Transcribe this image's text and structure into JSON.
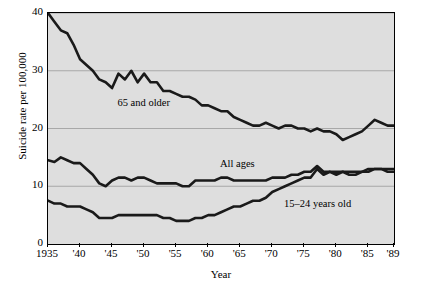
{
  "chart_data": {
    "type": "line",
    "title": "",
    "xlabel": "Year",
    "ylabel": "Suicide rate per 100,000",
    "xlim": [
      1935,
      1989
    ],
    "ylim": [
      0,
      40
    ],
    "yticks": [
      0,
      10,
      20,
      30,
      40
    ],
    "ytick_labels": [
      "0",
      "10",
      "20",
      "30",
      "40"
    ],
    "xticks": [
      1935,
      1940,
      1945,
      1950,
      1955,
      1960,
      1965,
      1970,
      1975,
      1980,
      1985,
      1989
    ],
    "xtick_labels": [
      "1935",
      "'40",
      "'45",
      "'50",
      "'55",
      "'60",
      "'65",
      "'70",
      "'75",
      "'80",
      "'85",
      "'89"
    ],
    "grid": "horizontal",
    "legend": "inline-annotations",
    "background": "#dedede",
    "line_color": "#1a1a1a",
    "series": [
      {
        "name": "65 and older",
        "label": "65 and older",
        "x": [
          1935,
          1936,
          1937,
          1938,
          1939,
          1940,
          1941,
          1942,
          1943,
          1944,
          1945,
          1946,
          1947,
          1948,
          1949,
          1950,
          1951,
          1952,
          1953,
          1954,
          1955,
          1956,
          1957,
          1958,
          1959,
          1960,
          1961,
          1962,
          1963,
          1964,
          1965,
          1966,
          1967,
          1968,
          1969,
          1970,
          1971,
          1972,
          1973,
          1974,
          1975,
          1976,
          1977,
          1978,
          1979,
          1980,
          1981,
          1982,
          1983,
          1984,
          1985,
          1986,
          1987,
          1988,
          1989
        ],
        "values": [
          40.0,
          38.5,
          37.0,
          36.5,
          34.5,
          32.0,
          31.0,
          30.0,
          28.5,
          28.0,
          27.0,
          29.5,
          28.5,
          30.0,
          28.0,
          29.5,
          28.0,
          28.0,
          26.5,
          26.5,
          26.0,
          25.5,
          25.5,
          25.0,
          24.0,
          24.0,
          23.5,
          23.0,
          23.0,
          22.0,
          21.5,
          21.0,
          20.5,
          20.5,
          21.0,
          20.5,
          20.0,
          20.5,
          20.5,
          20.0,
          20.0,
          19.5,
          20.0,
          19.5,
          19.5,
          19.0,
          18.0,
          18.5,
          19.0,
          19.5,
          20.5,
          21.5,
          21.0,
          20.5,
          20.5
        ]
      },
      {
        "name": "All ages",
        "label": "All ages",
        "x": [
          1935,
          1936,
          1937,
          1938,
          1939,
          1940,
          1941,
          1942,
          1943,
          1944,
          1945,
          1946,
          1947,
          1948,
          1949,
          1950,
          1951,
          1952,
          1953,
          1954,
          1955,
          1956,
          1957,
          1958,
          1959,
          1960,
          1961,
          1962,
          1963,
          1964,
          1965,
          1966,
          1967,
          1968,
          1969,
          1970,
          1971,
          1972,
          1973,
          1974,
          1975,
          1976,
          1977,
          1978,
          1979,
          1980,
          1981,
          1982,
          1983,
          1984,
          1985,
          1986,
          1987,
          1988,
          1989
        ],
        "values": [
          14.5,
          14.2,
          15.0,
          14.5,
          14.0,
          14.0,
          13.0,
          12.0,
          10.5,
          10.0,
          11.0,
          11.5,
          11.5,
          11.0,
          11.5,
          11.5,
          11.0,
          10.5,
          10.5,
          10.5,
          10.5,
          10.0,
          10.0,
          11.0,
          11.0,
          11.0,
          11.0,
          11.5,
          11.5,
          11.0,
          11.0,
          11.0,
          11.0,
          11.0,
          11.0,
          11.5,
          11.5,
          11.5,
          12.0,
          12.0,
          12.5,
          12.5,
          13.5,
          12.5,
          12.5,
          12.0,
          12.5,
          12.5,
          12.5,
          12.5,
          12.5,
          13.0,
          13.0,
          12.5,
          12.5
        ]
      },
      {
        "name": "15-24 years old",
        "label": "15–24 years old",
        "x": [
          1935,
          1936,
          1937,
          1938,
          1939,
          1940,
          1941,
          1942,
          1943,
          1944,
          1945,
          1946,
          1947,
          1948,
          1949,
          1950,
          1951,
          1952,
          1953,
          1954,
          1955,
          1956,
          1957,
          1958,
          1959,
          1960,
          1961,
          1962,
          1963,
          1964,
          1965,
          1966,
          1967,
          1968,
          1969,
          1970,
          1971,
          1972,
          1973,
          1974,
          1975,
          1976,
          1977,
          1978,
          1979,
          1980,
          1981,
          1982,
          1983,
          1984,
          1985,
          1986,
          1987,
          1988,
          1989
        ],
        "values": [
          7.5,
          7.0,
          7.0,
          6.5,
          6.5,
          6.5,
          6.0,
          5.5,
          4.5,
          4.5,
          4.5,
          5.0,
          5.0,
          5.0,
          5.0,
          5.0,
          5.0,
          5.0,
          4.5,
          4.5,
          4.0,
          4.0,
          4.0,
          4.5,
          4.5,
          5.0,
          5.0,
          5.5,
          6.0,
          6.5,
          6.5,
          7.0,
          7.5,
          7.5,
          8.0,
          9.0,
          9.5,
          10.0,
          10.5,
          11.0,
          11.5,
          11.5,
          13.0,
          12.0,
          12.5,
          12.5,
          12.5,
          12.0,
          12.0,
          12.5,
          13.0,
          13.0,
          13.0,
          13.0,
          13.0
        ]
      }
    ],
    "annotations": [
      {
        "text": "65 and older",
        "x": 1946,
        "y": 24
      },
      {
        "text": "All ages",
        "x": 1962,
        "y": 13.5
      },
      {
        "text": "15–24 years old",
        "x": 1972,
        "y": 6.5
      }
    ]
  }
}
